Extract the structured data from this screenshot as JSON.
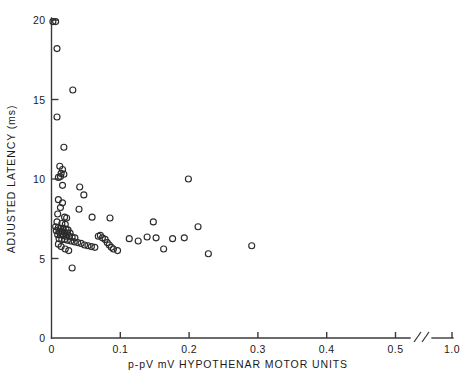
{
  "chart_data": {
    "type": "scatter",
    "title": "",
    "xlabel": "p-pV mV  HYPOTHENAR MOTOR UNITS",
    "ylabel": "ADJUSTED LATENCY (ms)",
    "xlim": [
      0,
      0.55
    ],
    "ylim": [
      0,
      20
    ],
    "grid": false,
    "legend": null,
    "axis_break": {
      "present": true,
      "symbol": "//",
      "between": [
        0.5,
        1.0
      ],
      "note": "x-axis is broken between the 0.5 tick and the 1.0 tick"
    },
    "xticks": [
      {
        "value": 0,
        "label": "0"
      },
      {
        "value": 0.1,
        "label": "0.1"
      },
      {
        "value": 0.2,
        "label": "0.2"
      },
      {
        "value": 0.3,
        "label": "0.3"
      },
      {
        "value": 0.4,
        "label": "0.4"
      },
      {
        "value": 0.5,
        "label": "0.5"
      },
      {
        "value": 1.0,
        "label": "1.0"
      }
    ],
    "yticks": [
      {
        "value": 0,
        "label": "0"
      },
      {
        "value": 5,
        "label": "5"
      },
      {
        "value": 10,
        "label": "10"
      },
      {
        "value": 15,
        "label": "15"
      },
      {
        "value": 20,
        "label": "20"
      }
    ],
    "marker_style": "open-circle",
    "marker_color": "#2b2b2b",
    "n_points": 76,
    "points": [
      [
        0.002,
        19.9
      ],
      [
        0.006,
        19.9
      ],
      [
        0.008,
        18.2
      ],
      [
        0.031,
        15.6
      ],
      [
        0.008,
        13.9
      ],
      [
        0.018,
        12.0
      ],
      [
        0.012,
        10.8
      ],
      [
        0.016,
        10.6
      ],
      [
        0.014,
        10.35
      ],
      [
        0.018,
        10.3
      ],
      [
        0.013,
        10.15
      ],
      [
        0.01,
        10.1
      ],
      [
        0.016,
        9.6
      ],
      [
        0.041,
        9.5
      ],
      [
        0.047,
        9.0
      ],
      [
        0.01,
        8.7
      ],
      [
        0.016,
        8.5
      ],
      [
        0.013,
        8.2
      ],
      [
        0.04,
        8.1
      ],
      [
        0.009,
        7.8
      ],
      [
        0.019,
        7.6
      ],
      [
        0.022,
        7.55
      ],
      [
        0.059,
        7.6
      ],
      [
        0.085,
        7.55
      ],
      [
        0.008,
        7.3
      ],
      [
        0.015,
        7.2
      ],
      [
        0.02,
        7.15
      ],
      [
        0.006,
        7.0
      ],
      [
        0.01,
        6.95
      ],
      [
        0.013,
        6.9
      ],
      [
        0.017,
        6.9
      ],
      [
        0.021,
        6.85
      ],
      [
        0.024,
        6.8
      ],
      [
        0.007,
        6.75
      ],
      [
        0.011,
        6.7
      ],
      [
        0.015,
        6.7
      ],
      [
        0.019,
        6.65
      ],
      [
        0.023,
        6.6
      ],
      [
        0.027,
        6.6
      ],
      [
        0.009,
        6.5
      ],
      [
        0.013,
        6.5
      ],
      [
        0.017,
        6.45
      ],
      [
        0.021,
        6.4
      ],
      [
        0.026,
        6.4
      ],
      [
        0.03,
        6.35
      ],
      [
        0.034,
        6.3
      ],
      [
        0.011,
        6.25
      ],
      [
        0.015,
        6.2
      ],
      [
        0.019,
        6.2
      ],
      [
        0.023,
        6.15
      ],
      [
        0.028,
        6.1
      ],
      [
        0.033,
        6.05
      ],
      [
        0.038,
        6.0
      ],
      [
        0.043,
        5.95
      ],
      [
        0.048,
        5.85
      ],
      [
        0.053,
        5.8
      ],
      [
        0.058,
        5.75
      ],
      [
        0.063,
        5.7
      ],
      [
        0.068,
        6.4
      ],
      [
        0.071,
        6.45
      ],
      [
        0.074,
        6.3
      ],
      [
        0.078,
        6.2
      ],
      [
        0.081,
        6.0
      ],
      [
        0.084,
        5.85
      ],
      [
        0.087,
        5.7
      ],
      [
        0.09,
        5.6
      ],
      [
        0.01,
        5.9
      ],
      [
        0.014,
        5.75
      ],
      [
        0.02,
        5.6
      ],
      [
        0.025,
        5.5
      ],
      [
        0.096,
        5.5
      ],
      [
        0.03,
        4.4
      ],
      [
        0.113,
        6.25
      ],
      [
        0.126,
        6.1
      ],
      [
        0.139,
        6.35
      ],
      [
        0.152,
        6.3
      ],
      [
        0.148,
        7.3
      ],
      [
        0.163,
        5.6
      ],
      [
        0.176,
        6.25
      ],
      [
        0.199,
        10.0
      ],
      [
        0.193,
        6.3
      ],
      [
        0.213,
        7.0
      ],
      [
        0.228,
        5.3
      ],
      [
        0.291,
        5.8
      ]
    ]
  },
  "axis_labels": {
    "y_title": "ADJUSTED LATENCY (ms)",
    "x_title": "p-pV mV  HYPOTHENAR MOTOR UNITS"
  }
}
